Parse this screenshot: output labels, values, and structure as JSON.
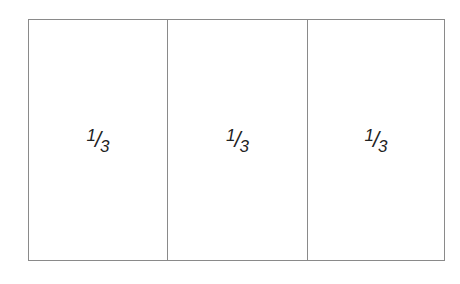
{
  "diagram": {
    "sections": [
      {
        "numerator": "1",
        "slash": "/",
        "denominator": "3"
      },
      {
        "numerator": "1",
        "slash": "/",
        "denominator": "3"
      },
      {
        "numerator": "1",
        "slash": "/",
        "denominator": "3"
      }
    ],
    "colors": {
      "border": "#8a8a8a",
      "text": "#222222",
      "background": "#ffffff"
    }
  }
}
